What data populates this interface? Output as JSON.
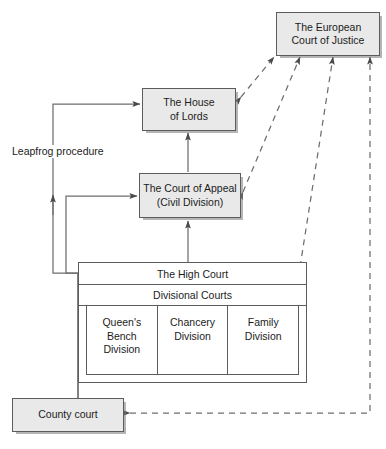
{
  "diagram": {
    "colors": {
      "node_fill": "#e9e9e9",
      "table_fill": "#ffffff",
      "stroke": "#5c5c5c",
      "text": "#1c1c1c",
      "background": "#ffffff"
    }
  },
  "nodes": {
    "ecj": {
      "line1": "The European",
      "line2": "Court of Justice"
    },
    "house_of_lords": {
      "line1": "The House",
      "line2": "of Lords"
    },
    "court_of_appeal": {
      "line1": "The Court of Appeal",
      "line2": "(Civil Division)"
    },
    "high_court": {
      "title": "The High Court",
      "subtitle": "Divisional Courts",
      "divisions": [
        {
          "line1": "Queen's",
          "line2": "Bench",
          "line3": "Division"
        },
        {
          "line1": "Chancery",
          "line2": "Division",
          "line3": ""
        },
        {
          "line1": "Family",
          "line2": "Division",
          "line3": ""
        }
      ]
    },
    "county_court": {
      "label": "County court"
    }
  },
  "labels": {
    "leapfrog": "Leapfrog procedure"
  },
  "connectors": [
    {
      "name": "high-court-to-court-of-appeal",
      "style": "solid",
      "direction": "up"
    },
    {
      "name": "court-of-appeal-to-house-of-lords",
      "style": "solid",
      "direction": "up"
    },
    {
      "name": "leapfrog-high-court-to-house-of-lords",
      "style": "solid",
      "direction": "up"
    },
    {
      "name": "county-court-to-court-of-appeal",
      "style": "solid",
      "direction": "up"
    },
    {
      "name": "house-of-lords-to-ecj",
      "style": "dashed",
      "direction": "both"
    },
    {
      "name": "court-of-appeal-to-ecj",
      "style": "dashed",
      "direction": "both"
    },
    {
      "name": "high-court-to-ecj",
      "style": "dashed",
      "direction": "both"
    },
    {
      "name": "county-court-to-ecj",
      "style": "dashed",
      "direction": "both"
    }
  ]
}
